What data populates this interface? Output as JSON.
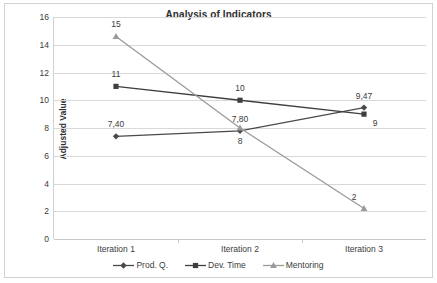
{
  "chart_data": {
    "type": "line",
    "title": "Analysis of Indicators",
    "xlabel": "",
    "ylabel": "Adjusted Value",
    "categories": [
      "Iteration 1",
      "Iteration 2",
      "Iteration 3"
    ],
    "ylim": [
      0,
      16
    ],
    "ytick_step": 2,
    "yticks": [
      "16",
      "14",
      "12",
      "10",
      "8",
      "6",
      "4",
      "2",
      "0"
    ],
    "grid": "horizontal",
    "legend_position": "bottom",
    "series": [
      {
        "name": "Prod. Q.",
        "marker": "diamond",
        "color": "#4a4a4a",
        "values": [
          7.4,
          7.8,
          9.47
        ],
        "labels": [
          "7,40",
          "7,80",
          "9,47"
        ],
        "label_positions": [
          "above",
          "above",
          "above"
        ]
      },
      {
        "name": "Dev. Time",
        "marker": "square",
        "color": "#3f3f3f",
        "values": [
          11,
          10,
          9
        ],
        "labels": [
          "11",
          "10",
          "9"
        ],
        "label_positions": [
          "above",
          "above",
          "below-right"
        ]
      },
      {
        "name": "Mentoring",
        "marker": "triangle",
        "color": "#9a9a9a",
        "values": [
          14.6,
          8.0,
          2.2
        ],
        "labels": [
          "15",
          "8",
          "2"
        ],
        "label_positions": [
          "above",
          "below",
          "above-right"
        ]
      }
    ]
  }
}
